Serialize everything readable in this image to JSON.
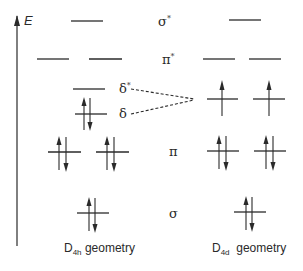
{
  "diagram": {
    "type": "molecular-orbital-energy-diagram",
    "axis": {
      "label": "E",
      "direction": "up"
    },
    "orbital_labels": [
      {
        "id": "sigma_star",
        "symbol": "σ",
        "sup": "*"
      },
      {
        "id": "pi_star",
        "symbol": "π",
        "sup": "*"
      },
      {
        "id": "delta_star",
        "symbol": "δ",
        "sup": "*"
      },
      {
        "id": "delta",
        "symbol": "δ",
        "sup": ""
      },
      {
        "id": "pi",
        "symbol": "π",
        "sup": ""
      },
      {
        "id": "sigma",
        "symbol": "σ",
        "sup": ""
      }
    ],
    "geometries": [
      {
        "name": "D4h",
        "caption_main": "D",
        "caption_sub": "4h",
        "caption_rest": " geometry",
        "levels": [
          {
            "orbital": "sigma_star",
            "degeneracy": 1,
            "electrons": [
              0
            ]
          },
          {
            "orbital": "pi_star",
            "degeneracy": 2,
            "electrons": [
              0,
              0
            ]
          },
          {
            "orbital": "delta_star",
            "degeneracy": 1,
            "electrons": [
              0
            ]
          },
          {
            "orbital": "delta",
            "degeneracy": 1,
            "electrons": [
              2
            ]
          },
          {
            "orbital": "pi",
            "degeneracy": 2,
            "electrons": [
              2,
              2
            ]
          },
          {
            "orbital": "sigma",
            "degeneracy": 1,
            "electrons": [
              2
            ]
          }
        ]
      },
      {
        "name": "D4d",
        "caption_main": "D",
        "caption_sub": "4d",
        "caption_rest": "  geometry",
        "levels": [
          {
            "orbital": "sigma_star",
            "degeneracy": 1,
            "electrons": [
              0
            ]
          },
          {
            "orbital": "pi_star",
            "degeneracy": 2,
            "electrons": [
              0,
              0
            ]
          },
          {
            "orbital": "delta_pair",
            "degeneracy": 2,
            "electrons": [
              1,
              1
            ]
          },
          {
            "orbital": "pi",
            "degeneracy": 2,
            "electrons": [
              2,
              2
            ]
          },
          {
            "orbital": "sigma",
            "degeneracy": 1,
            "electrons": [
              2
            ]
          }
        ]
      }
    ],
    "correlation": "δ* and δ (D4h) converge to degenerate pair (D4d), shown with dashed lines"
  }
}
